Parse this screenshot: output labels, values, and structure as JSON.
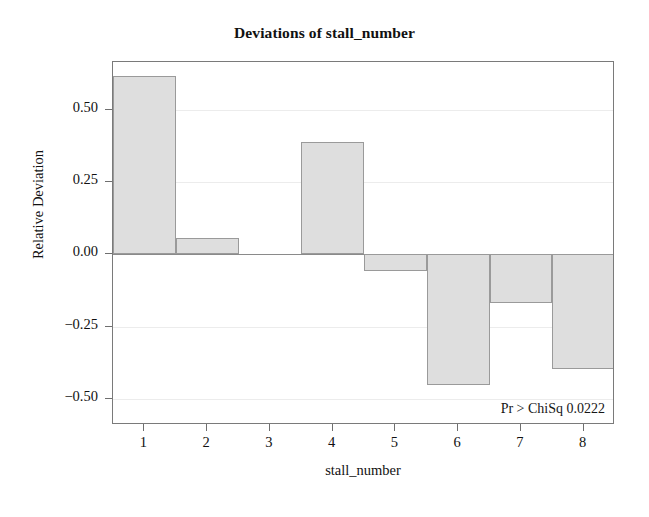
{
  "chart_data": {
    "type": "bar",
    "title": "Deviations of stall_number",
    "xlabel": "stall_number",
    "ylabel": "Relative Deviation",
    "categories": [
      "1",
      "2",
      "3",
      "4",
      "5",
      "6",
      "7",
      "8"
    ],
    "values": [
      0.615,
      0.057,
      0.0,
      0.389,
      -0.057,
      -0.452,
      -0.169,
      -0.395
    ],
    "ylim": [
      -0.59,
      0.665
    ],
    "yticks": [
      0.5,
      0.25,
      0.0,
      -0.25,
      -0.5
    ],
    "ytick_labels": [
      "0.50",
      "0.25",
      "0.00",
      "−0.25",
      "−0.50"
    ],
    "grid": true,
    "gridlines_at": [
      0.5,
      0.25,
      -0.25,
      -0.5
    ],
    "zero_line": true,
    "legend": null,
    "annotations": [
      {
        "text": "Pr > ChiSq 0.0222",
        "position": "bottom-right-inside-plot"
      }
    ],
    "colors": {
      "bar_fill": "#dedede",
      "bar_border": "#9a9a9a",
      "frame": "#7a7a7a",
      "gridline": "#ececec",
      "zero_line": "#8a8a8a",
      "text": "#111111",
      "background": "#ffffff"
    }
  }
}
